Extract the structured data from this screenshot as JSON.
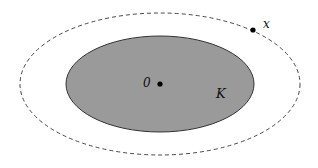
{
  "diagram": {
    "outer_boundary": {
      "style": "dashed",
      "stroke": "#333333"
    },
    "set_K": {
      "label": "K",
      "fill": "#9a9a9a",
      "stroke": "#333333"
    },
    "origin_point": {
      "label": "0"
    },
    "point_x": {
      "label": "x"
    }
  }
}
